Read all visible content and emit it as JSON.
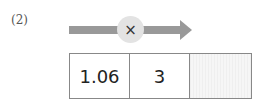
{
  "problem": {
    "number_label": "(2)",
    "operator": "×",
    "operator_icon": "multiply-icon",
    "arrow_icon": "right-arrow-icon",
    "colors": {
      "arrow": "#999999",
      "circle": "#e3e3e3",
      "blank_cell": "#f2f2f2"
    },
    "cells": [
      {
        "value": "1.06"
      },
      {
        "value": "3"
      },
      {
        "value": ""
      }
    ]
  }
}
